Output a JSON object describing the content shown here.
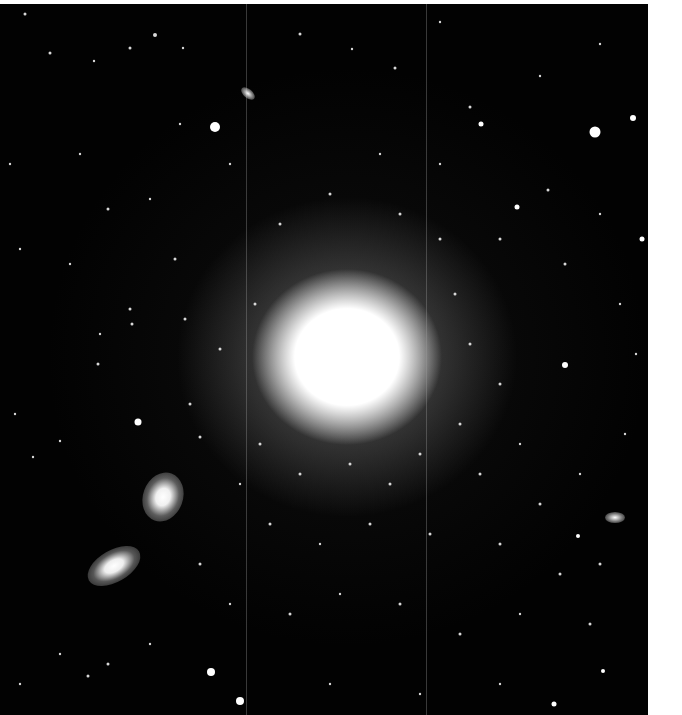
{
  "image": {
    "subject": "elliptical galaxy with surrounding globular clusters and two companion galaxies",
    "background_color": "#020202",
    "frame_color": "#ffffff",
    "core": {
      "cx": 347,
      "cy": 353,
      "rx": 95,
      "ry": 88,
      "color": "#ffffff"
    },
    "companions": [
      {
        "name": "companion-galaxy-upper",
        "cx": 163,
        "cy": 492,
        "rx": 12,
        "ry": 20,
        "rotate": 20
      },
      {
        "name": "companion-galaxy-lower",
        "cx": 113,
        "cy": 562,
        "rx": 22,
        "ry": 11,
        "rotate": -30
      },
      {
        "name": "small-galaxy-top",
        "cx": 247,
        "cy": 93,
        "rx": 7,
        "ry": 4,
        "rotate": 40
      },
      {
        "name": "small-galaxy-right",
        "cx": 615,
        "cy": 516,
        "rx": 8,
        "ry": 5,
        "rotate": 0
      }
    ],
    "seams_x": [
      246,
      426
    ]
  }
}
